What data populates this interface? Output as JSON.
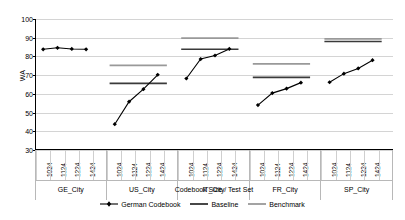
{
  "chart_data": {
    "type": "line",
    "title": "",
    "xlabel": "Codebook Size / Test Set",
    "ylabel": "WA",
    "ylim": [
      30,
      100
    ],
    "yticks": [
      30,
      40,
      50,
      60,
      70,
      80,
      90,
      100
    ],
    "grid": true,
    "legend_position": "bottom",
    "legend": [
      {
        "name": "German Codebook",
        "color": "#000000",
        "marker": "diamond"
      },
      {
        "name": "Baseline",
        "color": "#333333",
        "marker": "none"
      },
      {
        "name": "Benchmark",
        "color": "#999999",
        "marker": "none"
      }
    ],
    "categories": [
      "1024",
      "1124",
      "1224",
      "1424"
    ],
    "groups": [
      {
        "name": "GE_City",
        "series": [
          {
            "name": "German Codebook",
            "values": [
              83.8,
              84.6,
              84.0,
              83.8
            ]
          }
        ],
        "baseline": null,
        "benchmark": null
      },
      {
        "name": "US_City",
        "series": [
          {
            "name": "German Codebook",
            "values": [
              43.8,
              55.8,
              62.5,
              70.2
            ]
          }
        ],
        "baseline": 65.6,
        "benchmark": 75.2
      },
      {
        "name": "IT_City",
        "series": [
          {
            "name": "German Codebook",
            "values": [
              68.2,
              78.6,
              80.5,
              84.0
            ]
          }
        ],
        "baseline": 83.8,
        "benchmark": 89.8
      },
      {
        "name": "FR_City",
        "series": [
          {
            "name": "German Codebook",
            "values": [
              54.0,
              60.4,
              62.8,
              66.0
            ]
          }
        ],
        "baseline": 68.8,
        "benchmark": 76.0
      },
      {
        "name": "SP_City",
        "series": [
          {
            "name": "German Codebook",
            "values": [
              66.2,
              70.8,
              73.6,
              78.0
            ]
          }
        ],
        "baseline": 88.0,
        "benchmark": 89.4
      }
    ]
  }
}
